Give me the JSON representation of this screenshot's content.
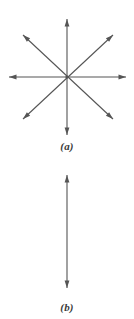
{
  "figure": {
    "background_color": "#ffffff",
    "stroke_color": "#555555",
    "label_color": "#3a3a3a",
    "width": 134,
    "height": 319,
    "panels": [
      {
        "id": "a",
        "label": "(a)",
        "description": "eight-ray star formed by four double-headed arrows crossing at a common center",
        "center": {
          "x": 67,
          "y": 77
        },
        "arrow_count": 4,
        "ray_count": 8,
        "arrows": [
          {
            "name": "vertical-double-arrow",
            "angle_deg": 90,
            "x1": 67,
            "y1": 19,
            "x2": 67,
            "y2": 135
          },
          {
            "name": "horizontal-double-arrow",
            "angle_deg": 0,
            "x1": 9,
            "y1": 77,
            "x2": 126,
            "y2": 77
          },
          {
            "name": "diagonal-up-right-double-arrow",
            "angle_deg": 45,
            "x1": 23,
            "y1": 119,
            "x2": 113,
            "y2": 35
          },
          {
            "name": "diagonal-up-left-double-arrow",
            "angle_deg": 135,
            "x1": 113,
            "y1": 119,
            "x2": 23,
            "y2": 35
          }
        ]
      },
      {
        "id": "b",
        "label": "(b)",
        "description": "single vertical double-headed arrow",
        "arrow_count": 1,
        "ray_count": 2,
        "arrows": [
          {
            "name": "vertical-double-arrow",
            "angle_deg": 90,
            "x1": 67,
            "y1": 15,
            "x2": 67,
            "y2": 128
          }
        ]
      }
    ]
  }
}
